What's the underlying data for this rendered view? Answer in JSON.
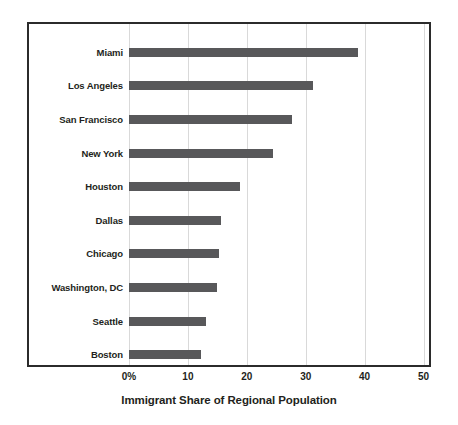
{
  "chart_data": {
    "type": "bar",
    "orientation": "horizontal",
    "title": "",
    "xlabel": "Immigrant Share of Regional Population",
    "ylabel": "",
    "categories": [
      "Miami",
      "Los Angeles",
      "San Francisco",
      "New York",
      "Houston",
      "Dallas",
      "Chicago",
      "Washington, DC",
      "Seattle",
      "Boston"
    ],
    "values": [
      38.8,
      31.2,
      27.6,
      24.5,
      18.8,
      15.7,
      15.2,
      15.0,
      13.0,
      12.2
    ],
    "series": [
      {
        "name": "Immigrant Share of Regional Population",
        "values": [
          38.8,
          31.2,
          27.6,
          24.5,
          18.8,
          15.7,
          15.2,
          15.0,
          13.0,
          12.2
        ]
      }
    ],
    "xlim": [
      0,
      51
    ],
    "x_ticks": [
      0,
      10,
      20,
      30,
      40,
      50
    ],
    "x_tick_labels": [
      "0%",
      "10",
      "20",
      "30",
      "40",
      "50"
    ],
    "grid": "vertical",
    "legend": "none",
    "bar_color": "#58585a",
    "gridline_color": "#d9d9d9",
    "frame_color": "#2b2b2b",
    "text_color": "#231f20"
  },
  "axis": {
    "title": "Immigrant Share of Regional Population"
  }
}
